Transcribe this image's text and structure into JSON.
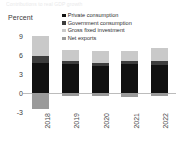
{
  "title_strip": "Contributions to real GDP growth",
  "unit_label": "Percent",
  "legend": {
    "items": [
      {
        "label": "Private consumption",
        "color": "#111111"
      },
      {
        "label": "Government consumption",
        "color": "#3d3d3d"
      },
      {
        "label": "Gross fixed investment",
        "color": "#c9c9c9"
      },
      {
        "label": "Net exports",
        "color": "#9a9a9a"
      }
    ]
  },
  "chart_data": {
    "type": "bar",
    "title": "Contributions to real GDP growth",
    "subtype": "stacked",
    "xlabel": "",
    "ylabel": "Percent",
    "ylim": [
      -3,
      9
    ],
    "yticks": [
      9,
      6,
      3,
      0,
      -3
    ],
    "ytick_labels": [
      "9",
      "6",
      "3",
      "0",
      "-3"
    ],
    "grid": false,
    "zero_line": true,
    "legend_position": "top-right",
    "categories": [
      "2018",
      "2019",
      "2020",
      "2021",
      "2022"
    ],
    "series": [
      {
        "name": "Private consumption",
        "color": "#111111",
        "values": [
          4.8,
          4.6,
          4.3,
          4.6,
          4.4
        ]
      },
      {
        "name": "Government consumption",
        "color": "#3d3d3d",
        "values": [
          1.1,
          0.5,
          0.4,
          0.4,
          0.6
        ]
      },
      {
        "name": "Gross fixed investment",
        "color": "#c9c9c9",
        "values": [
          3.1,
          1.7,
          1.9,
          1.6,
          2.1
        ]
      },
      {
        "name": "Net exports",
        "color": "#9a9a9a",
        "values": [
          -2.6,
          -0.5,
          -0.5,
          -0.6,
          -0.5
        ]
      }
    ]
  }
}
